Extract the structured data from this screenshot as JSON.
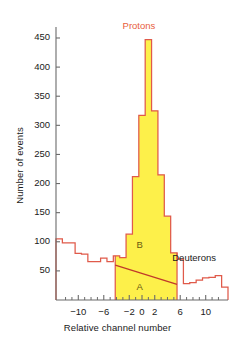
{
  "chart_data": {
    "type": "bar",
    "title": "",
    "xlabel": "Relative channel number",
    "ylabel": "Number of events",
    "xlim": [
      -13.5,
      13.5
    ],
    "ylim": [
      0,
      462
    ],
    "grid": false,
    "legend_position": "none",
    "bin_width": 1,
    "x": [
      -13,
      -12,
      -11,
      -10,
      -9,
      -8,
      -7,
      -6,
      -5,
      -4,
      -3,
      -2,
      -1,
      0,
      1,
      2,
      3,
      4,
      5,
      6,
      7,
      8,
      9,
      10,
      11,
      12,
      13
    ],
    "values": [
      105,
      98,
      98,
      80,
      79,
      66,
      66,
      72,
      66,
      76,
      73,
      113,
      212,
      317,
      447,
      325,
      215,
      144,
      81,
      70,
      28,
      30,
      34,
      38,
      39,
      42,
      22
    ],
    "categories": [
      "-13",
      "-12",
      "-11",
      "-10",
      "-9",
      "-8",
      "-7",
      "-6",
      "-5",
      "-4",
      "-3",
      "-2",
      "-1",
      "0",
      "1",
      "2",
      "3",
      "4",
      "5",
      "6",
      "7",
      "8",
      "9",
      "10",
      "11",
      "12",
      "13"
    ],
    "yticks": [
      50,
      100,
      150,
      200,
      250,
      300,
      350,
      400,
      450
    ],
    "ytick_labels": [
      "50",
      "100",
      "150",
      "200",
      "250",
      "300",
      "350",
      "400",
      "450"
    ],
    "xticks": [
      -10,
      -6,
      -2,
      0,
      2,
      6,
      10
    ],
    "xtick_labels": [
      "−10",
      "−6",
      "−2",
      "0",
      "2",
      "6",
      "10"
    ],
    "xminor_ticks": [
      -12,
      -11,
      -9,
      -8,
      -7,
      -5,
      -4,
      -3,
      -1,
      1,
      3,
      4,
      5,
      7,
      8,
      9,
      11,
      12
    ],
    "shaded_region": {
      "x_start": -4.2,
      "x_end": 5.5,
      "fill_color": "#fdf04a"
    },
    "divider_line": {
      "x1": -4.2,
      "y1": 60,
      "x2": 5.5,
      "y2": 27,
      "color": "#c0392b"
    },
    "annotations": [
      {
        "name": "protons",
        "text": "Protons",
        "x": 0.4,
        "y": 470,
        "color": "#e8603c"
      },
      {
        "name": "deuterons",
        "text": "Deuterons",
        "x": 8.2,
        "y": 72,
        "color": "#1a1a1a"
      },
      {
        "name": "region-b",
        "text": "B",
        "x": -0.4,
        "y": 95,
        "color": "#6b5a10"
      },
      {
        "name": "region-a",
        "text": "A",
        "x": -0.4,
        "y": 22,
        "color": "#6b5a10"
      }
    ],
    "colors": {
      "histogram_line": "#e05a4a",
      "histogram_fill": "#fdf04a",
      "divider": "#c0392b",
      "axis": "#6b6b6b",
      "text": "#1a1a1a"
    }
  }
}
